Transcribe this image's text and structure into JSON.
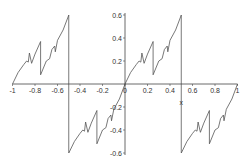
{
  "chart_data": {
    "type": "line",
    "title": "",
    "xlabel": "x",
    "ylabel": "",
    "xlim": [
      -1,
      1
    ],
    "ylim": [
      -0.6,
      0.6
    ],
    "grid": false,
    "legend": null,
    "axes_style": "crossing at origin",
    "x_ticks": [
      -1,
      -0.8,
      -0.6,
      -0.4,
      -0.2,
      0,
      0.2,
      0.4,
      0.6,
      0.8,
      1
    ],
    "x_tick_labels": [
      "-1",
      "-0.8",
      "-0.6",
      "-0.4",
      "-0.2",
      "0",
      "0.2",
      "0.4",
      "0.6",
      "0.8",
      "1"
    ],
    "y_ticks": [
      0.6,
      0.4,
      0.2,
      -0.2,
      -0.4,
      -0.6
    ],
    "y_tick_labels": [
      "0.6",
      "0.4",
      "0.2",
      "-0.2",
      "-0.4",
      "-0.6"
    ],
    "line_color": "#555555",
    "series": [
      {
        "name": "f(x)",
        "note": "period-1 sawtooth-like fractal curve; jumps at x=-0.5 and x=0.5",
        "segments": [
          {
            "x": [
              -1,
              -0.95,
              -0.9,
              -0.875,
              -0.86,
              -0.85,
              -0.83,
              -0.8,
              -0.75,
              -0.75,
              -0.7,
              -0.67,
              -0.65,
              -0.625,
              -0.62,
              -0.6,
              -0.55,
              -0.5
            ],
            "y": [
              0,
              0.1,
              0.17,
              0.2,
              0.19,
              0.27,
              0.18,
              0.26,
              0.37,
              0.08,
              0.2,
              0.22,
              0.3,
              0.33,
              0.28,
              0.38,
              0.47,
              0.6
            ]
          },
          {
            "x": [
              -0.5,
              -0.45,
              -0.4,
              -0.375,
              -0.36,
              -0.35,
              -0.33,
              -0.3,
              -0.25,
              -0.25,
              -0.2,
              -0.17,
              -0.15,
              -0.125,
              -0.12,
              -0.1,
              -0.05,
              0
            ],
            "y": [
              -0.6,
              -0.5,
              -0.43,
              -0.4,
              -0.41,
              -0.33,
              -0.42,
              -0.34,
              -0.23,
              -0.52,
              -0.4,
              -0.38,
              -0.3,
              -0.27,
              -0.32,
              -0.22,
              -0.13,
              0
            ]
          },
          {
            "x": [
              0,
              0.05,
              0.1,
              0.125,
              0.14,
              0.15,
              0.17,
              0.2,
              0.25,
              0.25,
              0.3,
              0.33,
              0.35,
              0.375,
              0.38,
              0.4,
              0.45,
              0.5
            ],
            "y": [
              0,
              0.1,
              0.17,
              0.2,
              0.19,
              0.27,
              0.18,
              0.26,
              0.37,
              0.08,
              0.2,
              0.22,
              0.3,
              0.33,
              0.28,
              0.38,
              0.47,
              0.6
            ]
          },
          {
            "x": [
              0.5,
              0.55,
              0.6,
              0.625,
              0.64,
              0.65,
              0.67,
              0.7,
              0.75,
              0.75,
              0.8,
              0.83,
              0.85,
              0.875,
              0.88,
              0.9,
              0.95,
              1
            ],
            "y": [
              -0.6,
              -0.5,
              -0.43,
              -0.4,
              -0.41,
              -0.33,
              -0.42,
              -0.34,
              -0.23,
              -0.52,
              -0.4,
              -0.38,
              -0.3,
              -0.27,
              -0.32,
              -0.22,
              -0.13,
              0
            ]
          }
        ],
        "vertical_jumps": [
          {
            "x": -0.5,
            "from": 0.6,
            "to": -0.6
          },
          {
            "x": 0.5,
            "from": 0.6,
            "to": -0.6
          }
        ]
      }
    ]
  }
}
